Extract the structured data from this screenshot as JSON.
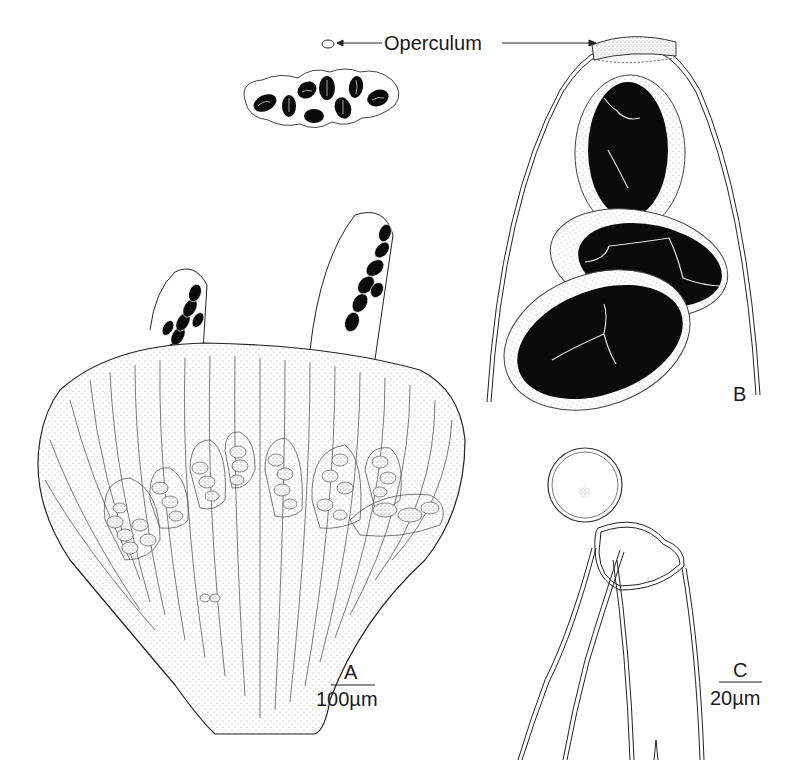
{
  "figure": {
    "labels": {
      "operculum": "Operculum",
      "panel_a": "A",
      "panel_b": "B",
      "panel_c": "C",
      "scale_a": "100µm",
      "scale_c": "20µm"
    },
    "panels": [
      {
        "id": "A",
        "description": "Apothecium cross-section with paraphyses, asci and two protruding asci containing dark ascospores",
        "scale": "100µm"
      },
      {
        "id": "B",
        "description": "Ascus tip with operculum and three dark ascospores in hyaline sheaths"
      },
      {
        "id": "C",
        "description": "Ascus apex with open operculum (lid) and paraphyses",
        "scale": "20µm"
      }
    ],
    "colors": {
      "ink": "#111111",
      "spore_fill": "#0a0a0a",
      "sheath_fill": "#f2f2f2",
      "background": "#ffffff"
    }
  }
}
